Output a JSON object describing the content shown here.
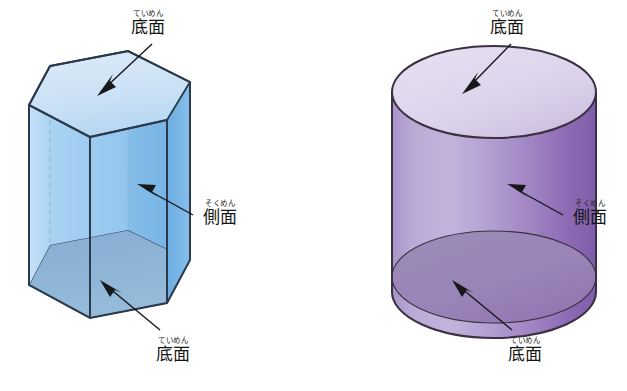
{
  "page": {
    "background_color": "#ffffff",
    "width": 627,
    "height": 391
  },
  "labels": {
    "base_face": {
      "furigana": "ていめん",
      "text": "底面"
    },
    "lateral_face": {
      "furigana": "そくめん",
      "text": "側面"
    }
  },
  "figures": [
    {
      "name": "hexagonal-prism",
      "shape": "hexagonal prism",
      "colors": {
        "top_face": "#cfe4f7",
        "front_left_face": "#b6daf5",
        "front_mid_face": "#9ecbf0",
        "front_right_face": "#7fb9e8",
        "bottom_face": "#8fb4d8",
        "outline": "#2b3a4a",
        "hidden_edge": "#8fb0cc"
      },
      "annotations": [
        {
          "target": "top-base-face",
          "label_key": "base_face"
        },
        {
          "target": "lateral-face",
          "label_key": "lateral_face"
        },
        {
          "target": "bottom-base-face",
          "label_key": "base_face"
        }
      ]
    },
    {
      "name": "cylinder",
      "shape": "cylinder",
      "colors": {
        "top_face": "#ddd5ec",
        "lateral_left": "#b9a8d4",
        "lateral_mid": "#a98fc6",
        "lateral_right": "#8e6bb0",
        "bottom_face": "#9b86b8",
        "outline": "#3a3040"
      },
      "annotations": [
        {
          "target": "top-base-face",
          "label_key": "base_face"
        },
        {
          "target": "lateral-face",
          "label_key": "lateral_face"
        },
        {
          "target": "bottom-base-face",
          "label_key": "base_face"
        }
      ]
    }
  ]
}
